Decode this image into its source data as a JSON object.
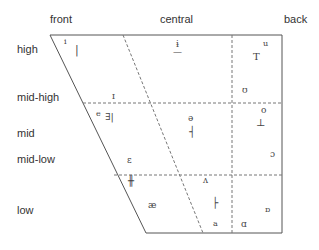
{
  "columns": {
    "front": "front",
    "central": "central",
    "back": "back"
  },
  "rows": {
    "high": "high",
    "mid_high": "mid-high",
    "mid": "mid",
    "mid_low": "mid-low",
    "low": "low"
  },
  "symbols": {
    "i": "i",
    "i_marker": "|",
    "barred_i": "ɨ",
    "barred_i_marker": "—",
    "u": "u",
    "u_marker": "T",
    "small_cap_i": "ɪ",
    "upsilon": "ʊ",
    "e": "e",
    "e_marker": "∃|",
    "schwa": "ə",
    "schwa_marker": "┤",
    "o": "o",
    "o_marker": "⊥",
    "open_o": "ɔ",
    "epsilon": "ɛ",
    "epsilon_marker": "╫",
    "ash": "æ",
    "wedge": "ʌ",
    "wedge_marker": "├",
    "a": "a",
    "script_a": "ɑ",
    "turned_script_a": "ɒ"
  },
  "colors": {
    "line": "#555555",
    "dash": "#777777",
    "text": "#333333"
  }
}
